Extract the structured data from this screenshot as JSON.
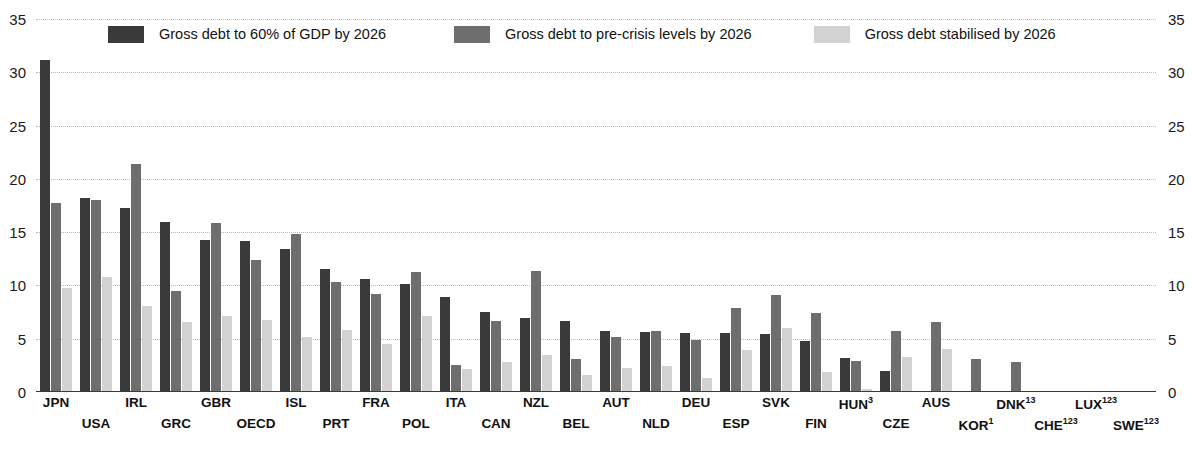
{
  "chart_data": {
    "type": "bar",
    "title": "",
    "xlabel": "",
    "ylabel": "",
    "ylim": [
      0,
      35
    ],
    "yticks": [
      0,
      5,
      10,
      15,
      20,
      25,
      30,
      35
    ],
    "grid": true,
    "legend_position": "top",
    "dual_y_axis": true,
    "categories": [
      "JPN",
      "USA",
      "IRL",
      "GRC",
      "GBR",
      "OECD",
      "ISL",
      "PRT",
      "FRA",
      "POL",
      "ITA",
      "CAN",
      "NZL",
      "BEL",
      "AUT",
      "NLD",
      "DEU",
      "ESP",
      "SVK",
      "FIN",
      "HUN",
      "CZE",
      "AUS",
      "KOR",
      "DNK",
      "CHE",
      "LUX",
      "SWE"
    ],
    "category_footnotes": [
      "",
      "",
      "",
      "",
      "",
      "",
      "",
      "",
      "",
      "",
      "",
      "",
      "",
      "",
      "",
      "",
      "",
      "",
      "",
      "",
      "3",
      "",
      "",
      "1",
      "13",
      "123",
      "123",
      "123"
    ],
    "series": [
      {
        "name": "Gross debt to 60% of GDP by 2026",
        "color": "#3a3a3a",
        "values": [
          31.2,
          18.2,
          17.3,
          16.0,
          14.3,
          14.2,
          13.4,
          11.5,
          10.6,
          10.1,
          8.9,
          7.5,
          6.9,
          6.7,
          5.7,
          5.6,
          5.5,
          5.5,
          5.4,
          4.8,
          3.2,
          2.0,
          0.0,
          0.0,
          0.0,
          0.0,
          0.0,
          0.0
        ]
      },
      {
        "name": "Gross debt to pre-crisis levels by 2026",
        "color": "#6e6e6e",
        "values": [
          17.7,
          18.0,
          21.4,
          9.5,
          15.9,
          12.4,
          14.8,
          10.3,
          9.2,
          11.3,
          2.5,
          6.7,
          11.4,
          3.1,
          5.2,
          5.7,
          4.9,
          7.9,
          9.1,
          7.4,
          2.9,
          5.7,
          6.6,
          3.1,
          2.8,
          0.0,
          0.0,
          0.0
        ]
      },
      {
        "name": "Gross debt stabilised by 2026",
        "color": "#d2d2d2",
        "values": [
          9.8,
          10.8,
          8.1,
          6.6,
          7.1,
          6.8,
          5.2,
          5.8,
          4.5,
          7.1,
          2.2,
          2.8,
          3.5,
          1.6,
          2.3,
          2.4,
          1.3,
          3.9,
          6.0,
          1.9,
          0.3,
          3.3,
          4.0,
          0.0,
          0.0,
          0.0,
          0.0,
          0.0
        ]
      }
    ]
  },
  "legend": {
    "items": [
      {
        "label": "Gross debt to 60% of GDP by 2026",
        "color": "#3a3a3a"
      },
      {
        "label": "Gross debt to pre-crisis levels by 2026",
        "color": "#6e6e6e"
      },
      {
        "label": "Gross debt stabilised by 2026",
        "color": "#d2d2d2"
      }
    ]
  },
  "axis": {
    "left_ticks": [
      "35",
      "30",
      "25",
      "20",
      "15",
      "10",
      "5",
      "0"
    ],
    "right_ticks": [
      "35",
      "30",
      "25",
      "20",
      "15",
      "10",
      "5",
      "0"
    ]
  }
}
